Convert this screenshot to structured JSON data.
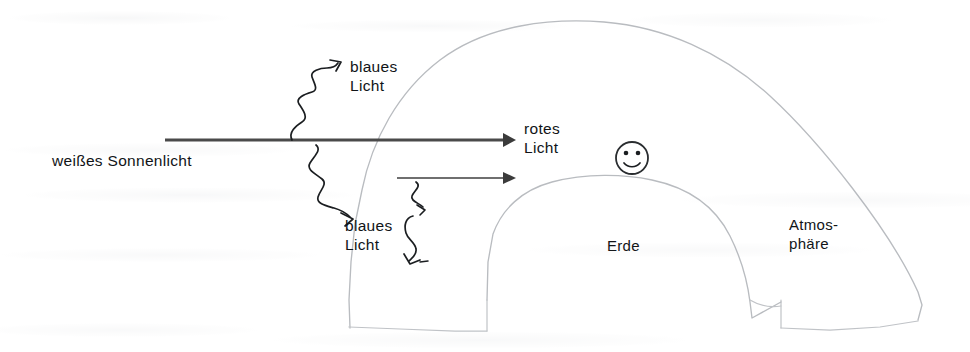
{
  "diagram": {
    "language": "de",
    "colors": {
      "ink": "#111417",
      "beam": "#4a4a4a",
      "arc": "#b9bcc0",
      "background": "#ffffff"
    },
    "labels": {
      "white_sunlight": "weißes Sonnenlicht",
      "blue_light_upper": "blaues\nLicht",
      "red_light": "rotes\nLicht",
      "blue_light_lower": "blaues\nLicht",
      "earth": "Erde",
      "atmosphere": "Atmos-\nphäre"
    },
    "elements": {
      "beam_primary": "thick-horizontal-arrow-white-sunlight",
      "beam_secondary": "thin-horizontal-arrow",
      "scatter_arrows": [
        "wavy-arrow-up-right",
        "wavy-arrow-down-right",
        "wavy-arrow-down-short",
        "wavy-arrow-down-long"
      ],
      "outer_arc": "atmosphere-boundary",
      "inner_arc": "earth-surface",
      "observer": "smiley-face-observer"
    }
  }
}
